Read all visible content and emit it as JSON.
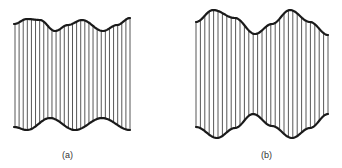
{
  "figures": [
    {
      "id": "a",
      "label": "(a)",
      "label_pos": [
        62,
        150
      ],
      "x_start": 15,
      "x_end": 130,
      "hatch_count": 29,
      "top_curve": [
        [
          14,
          24
        ],
        [
          27,
          19
        ],
        [
          40,
          20
        ],
        [
          55,
          31
        ],
        [
          68,
          25
        ],
        [
          82,
          20
        ],
        [
          103,
          31
        ],
        [
          117,
          25
        ],
        [
          130,
          18
        ]
      ],
      "bottom_curve": [
        [
          14,
          127
        ],
        [
          27,
          130
        ],
        [
          50,
          118
        ],
        [
          75,
          130
        ],
        [
          102,
          118
        ],
        [
          130,
          130
        ]
      ]
    },
    {
      "id": "b",
      "label": "(b)",
      "label_pos": [
        261,
        150
      ],
      "x_start": 196,
      "x_end": 328,
      "hatch_count": 31,
      "top_curve": [
        [
          196,
          22
        ],
        [
          213,
          10
        ],
        [
          235,
          18
        ],
        [
          255,
          34
        ],
        [
          272,
          24
        ],
        [
          290,
          10
        ],
        [
          310,
          22
        ],
        [
          328,
          35
        ]
      ],
      "bottom_curve": [
        [
          196,
          127
        ],
        [
          217,
          138
        ],
        [
          235,
          128
        ],
        [
          253,
          114
        ],
        [
          272,
          126
        ],
        [
          292,
          138
        ],
        [
          310,
          128
        ],
        [
          328,
          114
        ]
      ]
    }
  ],
  "colors": {
    "stroke": "#1a1a1a",
    "hatch": "#444444",
    "background": "#ffffff"
  }
}
